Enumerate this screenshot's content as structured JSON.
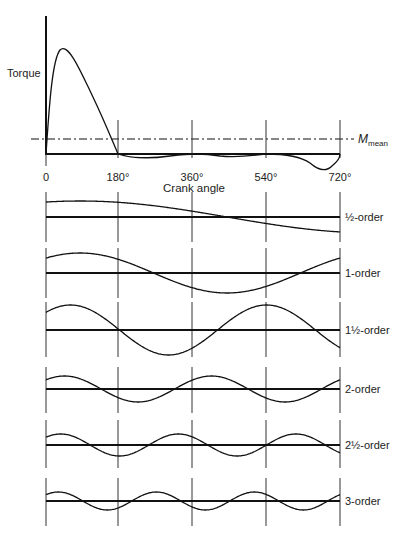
{
  "top_chart": {
    "ylabel": "Torque",
    "xlabel": "Crank angle",
    "mean_label_main": "M",
    "mean_label_sub": "mean",
    "x_ticks": [
      "0",
      "180°",
      "360°",
      "540°",
      "720°"
    ]
  },
  "orders": [
    {
      "label": "½-order",
      "order": 0.5
    },
    {
      "label": "1-order",
      "order": 1
    },
    {
      "label": "1½-order",
      "order": 1.5
    },
    {
      "label": "2-order",
      "order": 2
    },
    {
      "label": "2½-order",
      "order": 2.5
    },
    {
      "label": "3-order",
      "order": 3
    }
  ],
  "chart_data": {
    "type": "line",
    "title": "",
    "xlabel": "Crank angle",
    "ylabel": "Torque",
    "xlim": [
      0,
      720
    ],
    "x_ticks": [
      0,
      180,
      360,
      540,
      720
    ],
    "series": [
      {
        "name": "Torque (one cycle)",
        "description": "large positive peak near 40°, crosses M_mean around 150°, returns to zero at 180°, slightly negative 180°–540°, negative dip near 680°, back to zero at 720°"
      },
      {
        "name": "M_mean",
        "style": "dash-dot",
        "level": "small positive constant"
      },
      {
        "name": "½-order",
        "periods_per_720": 1,
        "relative_amplitude": 0.6
      },
      {
        "name": "1-order",
        "periods_per_720": 2,
        "relative_amplitude": 0.8
      },
      {
        "name": "1½-order",
        "periods_per_720": 3,
        "relative_amplitude": 1.0
      },
      {
        "name": "2-order",
        "periods_per_720": 4,
        "relative_amplitude": 0.55
      },
      {
        "name": "2½-order",
        "periods_per_720": 5,
        "relative_amplitude": 0.45
      },
      {
        "name": "3-order",
        "periods_per_720": 6,
        "relative_amplitude": 0.36
      }
    ]
  }
}
